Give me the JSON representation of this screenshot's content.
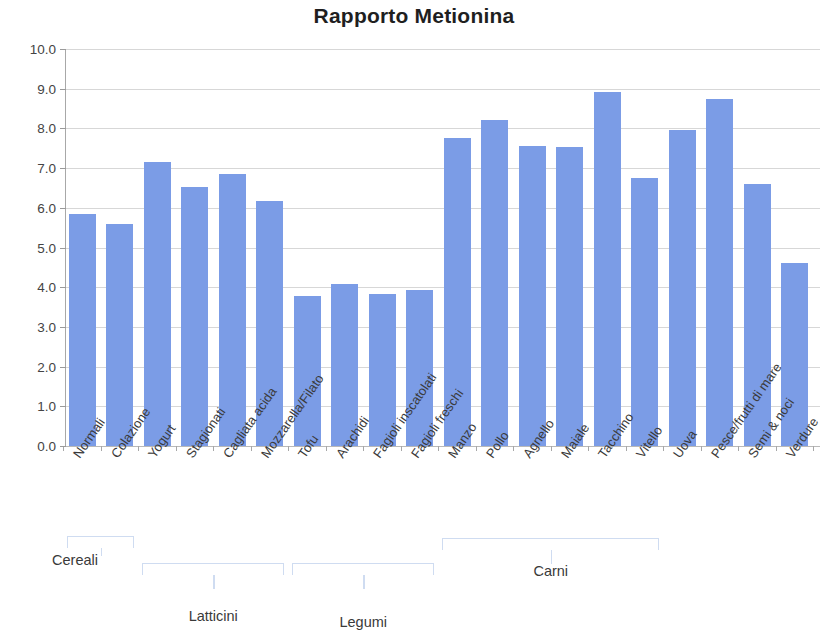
{
  "chart_data": {
    "type": "bar",
    "title": "Rapporto Metionina",
    "xlabel": "",
    "ylabel": "",
    "ylim": [
      0.0,
      10.0
    ],
    "ytick_labels": [
      "10.0",
      "9.0",
      "8.0",
      "7.0",
      "6.0",
      "5.0",
      "4.0",
      "3.0",
      "2.0",
      "1.0",
      "0.0"
    ],
    "ytick_values": [
      10.0,
      9.0,
      8.0,
      7.0,
      6.0,
      5.0,
      4.0,
      3.0,
      2.0,
      1.0,
      0.0
    ],
    "grid": true,
    "legend": false,
    "bar_color": "#7b9ce6",
    "categories": [
      "Normali",
      "Colazione",
      "Yogurt",
      "Stagionati",
      "Cagliata acida",
      "Mozzarella/Filato",
      "Tofu",
      "Arachidi",
      "Fagioli inscatolati",
      "Fagioli freschi",
      "Manzo",
      "Pollo",
      "Agnello",
      "Maiale",
      "Tacchino",
      "Vitello",
      "Uova",
      "Pesce/frutti di mare",
      "Semi & noci",
      "Verdure"
    ],
    "values": [
      5.85,
      5.6,
      7.15,
      6.52,
      6.85,
      6.18,
      3.78,
      4.08,
      3.82,
      3.92,
      7.75,
      8.22,
      7.55,
      7.52,
      8.92,
      6.75,
      7.95,
      8.73,
      6.6,
      4.6
    ],
    "groups": [
      {
        "label": "Cereali",
        "first_index": 0,
        "last_index": 1
      },
      {
        "label": "Latticini",
        "first_index": 2,
        "last_index": 5
      },
      {
        "label": "Legumi",
        "first_index": 6,
        "last_index": 9
      },
      {
        "label": "Carni",
        "first_index": 10,
        "last_index": 15
      }
    ]
  }
}
